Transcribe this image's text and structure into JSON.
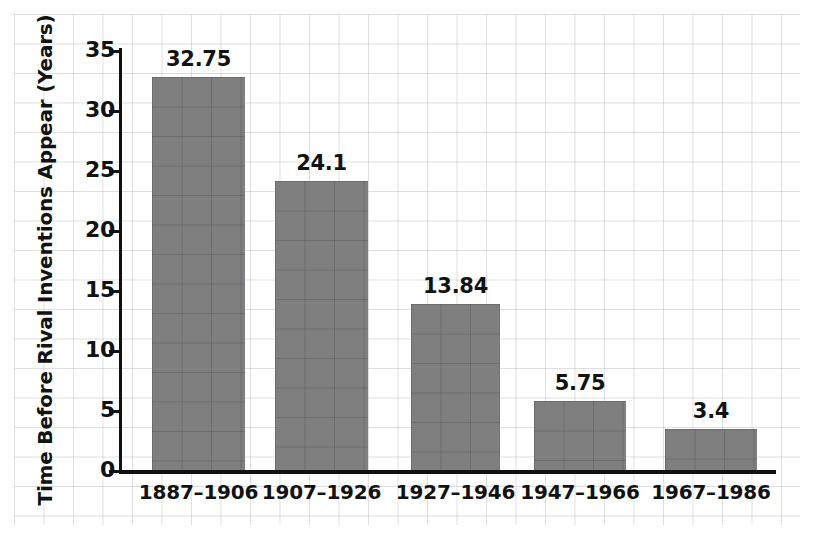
{
  "chart_data": {
    "type": "bar",
    "title": "",
    "subtitle": "",
    "xlabel": "",
    "ylabel": "Time Before Rival Inventions Appear (Years)",
    "categories": [
      "1887–1906",
      "1907–1926",
      "1927–1946",
      "1947–1966",
      "1967–1986"
    ],
    "values": [
      32.75,
      24.1,
      13.84,
      5.75,
      3.4
    ],
    "value_labels": [
      "32.75",
      "24.1",
      "13.84",
      "5.75",
      "3.4"
    ],
    "ylim": [
      0,
      35
    ],
    "yticks": [
      0,
      5,
      10,
      15,
      20,
      25,
      30,
      35
    ],
    "ytick_labels": [
      "0",
      "5",
      "10",
      "15",
      "20",
      "25",
      "30",
      "35"
    ],
    "xlim_note": "categorical",
    "grid": true,
    "grid_style": "graph-paper background, light gray squares",
    "legend": false,
    "legend_position": "none",
    "bar_color": "#7f7f7f",
    "axis_color": "#111111",
    "text_color": "#121212",
    "background_color": "#ffffff",
    "annotations": []
  }
}
